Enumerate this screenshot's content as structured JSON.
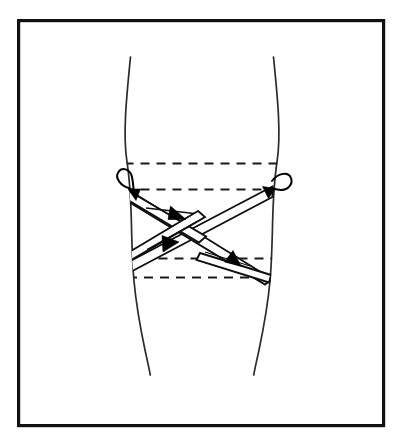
{
  "figure": {
    "title": "Figure-eight knee bandage wrap diagram",
    "caption": "",
    "background_color": "#ffffff",
    "frame": {
      "stroke_color": "#111111",
      "fill_color": "#ffffff",
      "x": 17,
      "y": 19,
      "width": 368,
      "height": 408,
      "stroke_width": 3.2
    }
  },
  "subject": {
    "name": "leg-knee",
    "outline_color": "#2b2b2b",
    "description": "Anterior view of a leg showing the knee region"
  },
  "wrap": {
    "band_color": "#111111",
    "band_fill": "#ffffff",
    "dashed_color": "#1a1a1a",
    "arrow_color": "#000000",
    "turns": [
      {
        "name": "anchor-turn-upper",
        "style": "dashed",
        "y": 163,
        "direction": "horizontal"
      },
      {
        "name": "anchor-turn-second",
        "style": "dashed",
        "y": 189,
        "direction": "horizontal"
      },
      {
        "name": "anchor-turn-lower",
        "style": "dashed",
        "y": 258,
        "direction": "horizontal"
      },
      {
        "name": "anchor-turn-bottom",
        "style": "dashed",
        "y": 277,
        "direction": "horizontal"
      }
    ],
    "diagonals": [
      {
        "name": "diagonal-descending-left-to-right",
        "from": "upper-left",
        "to": "lower-right",
        "arrow_count": 2
      },
      {
        "name": "diagonal-ascending-right-to-left",
        "from": "upper-right",
        "to": "lower-left",
        "arrow_count": 1
      }
    ],
    "loops": [
      {
        "name": "loop-arrow-left",
        "side": "left",
        "points": "down-right"
      },
      {
        "name": "loop-arrow-right",
        "side": "right",
        "points": "down-right"
      }
    ],
    "arrows": [
      {
        "name": "arrow-direction-1",
        "x": 178,
        "y": 213,
        "points": "down-right"
      },
      {
        "name": "arrow-direction-2",
        "x": 171,
        "y": 245,
        "points": "down-left"
      },
      {
        "name": "arrow-direction-3",
        "x": 233,
        "y": 259,
        "points": "down-right"
      }
    ]
  }
}
